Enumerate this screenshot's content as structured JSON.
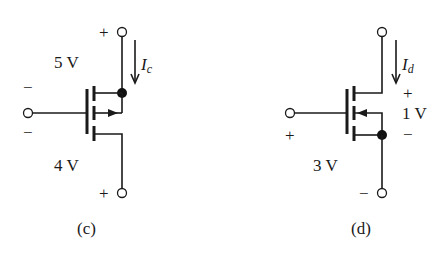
{
  "figure": {
    "background": "#ffffff",
    "ink_color": "#1a1a1a"
  },
  "circuits": [
    {
      "id": "c",
      "caption": "(c)",
      "device": "MOSFET (4-terminal, body tied to drain node)",
      "gate_polarity_top": "−",
      "gate_polarity_bottom": "−",
      "upper_voltage": "5 V",
      "lower_voltage": "4 V",
      "top_terminal_sign": "+",
      "bottom_terminal_sign": "+",
      "current_label": "I",
      "current_subscript": "c",
      "arrow_direction": "right"
    },
    {
      "id": "d",
      "caption": "(d)",
      "device": "MOSFET (4-terminal, body tied to source node)",
      "gate_sign": "+",
      "gate_voltage": "3 V",
      "ds_plus": "+",
      "ds_voltage": "1 V",
      "ds_minus": "−",
      "bottom_terminal_sign": "−",
      "current_label": "I",
      "current_subscript": "d",
      "arrow_direction": "left"
    }
  ]
}
